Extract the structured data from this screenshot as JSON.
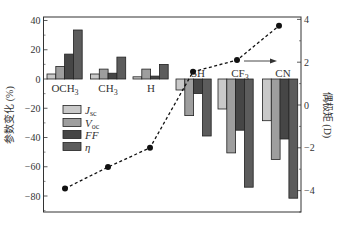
{
  "chart_data": {
    "type": "bar",
    "title": "",
    "xlabel": "",
    "ylabel": "参数变化 (%)",
    "ylabel_right": "偶极矩 (D)",
    "ylim": [
      -90,
      42
    ],
    "ylim_right": [
      -5.0,
      4.4
    ],
    "yticks": [
      40,
      20,
      0,
      -20,
      -40,
      -60,
      -80
    ],
    "yticks_right": [
      4,
      2,
      0,
      -2,
      -4
    ],
    "categories": [
      "OCH3",
      "CH3",
      "H",
      "SH",
      "CF3",
      "CN"
    ],
    "category_labels": [
      {
        "base": "OCH",
        "sub": "3"
      },
      {
        "base": "CH",
        "sub": "3"
      },
      {
        "base": "H",
        "sub": ""
      },
      {
        "base": "SH",
        "sub": ""
      },
      {
        "base": "CF",
        "sub": "3"
      },
      {
        "base": "CN",
        "sub": ""
      }
    ],
    "series": [
      {
        "name": "Jsc",
        "label_base": "J",
        "label_sub": "sc",
        "color": "#c9c9c9",
        "values": [
          3.4,
          3.4,
          1.5,
          -7.5,
          -20.5,
          -28.5
        ]
      },
      {
        "name": "Voc",
        "label_base": "V",
        "label_sub": "oc",
        "color": "#9e9e9e",
        "values": [
          8.6,
          6.8,
          6.8,
          -25,
          -50.5,
          -55
        ]
      },
      {
        "name": "FF",
        "label_base": "FF",
        "label_sub": "",
        "color": "#464646",
        "values": [
          17,
          4,
          2,
          -10,
          -35,
          -41
        ]
      },
      {
        "name": "η",
        "label_base": "η",
        "label_sub": "",
        "color": "#5c5c5c",
        "values": [
          33.5,
          15,
          10,
          -39,
          -74,
          -81.5
        ]
      }
    ],
    "line_series": {
      "name": "Dipole moment",
      "axis": "right",
      "style": "dashed",
      "marker": "circle",
      "color": "#111111",
      "values": [
        -3.9,
        -2.9,
        -2.0,
        1.55,
        2.1,
        3.7
      ]
    },
    "annotations": [
      {
        "type": "arrow",
        "from": "CF3 dipole point",
        "direction": "right",
        "meaning": "line refers to right axis"
      }
    ],
    "legend_position": "left-center inside plot",
    "grid": false
  }
}
